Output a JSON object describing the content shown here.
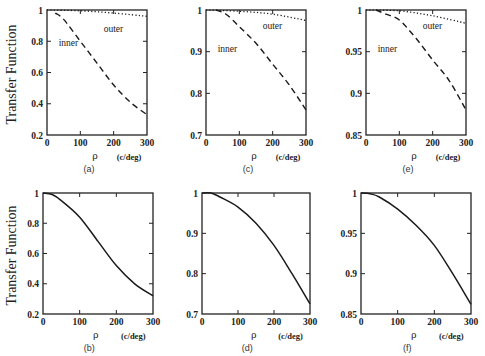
{
  "chart_data": [
    {
      "id": "a",
      "type": "line",
      "caption": "(a)",
      "xlabel": "ρ",
      "xunit": "(c/deg)",
      "ylabel": "Transfer Function",
      "xlim": [
        0,
        300
      ],
      "ylim": [
        0.2,
        1.0
      ],
      "xticks": [
        "0",
        "100",
        "200",
        "300"
      ],
      "yticks": [
        "0.2",
        "0.4",
        "0.6",
        "0.8",
        "1"
      ],
      "series": [
        {
          "name": "inner",
          "style": "dashed",
          "x": [
            25,
            50,
            100,
            150,
            200,
            250,
            300
          ],
          "y": [
            0.98,
            0.94,
            0.8,
            0.66,
            0.52,
            0.41,
            0.33
          ]
        },
        {
          "name": "outer",
          "style": "dotted",
          "x": [
            0,
            100,
            200,
            300
          ],
          "y": [
            1.0,
            0.995,
            0.98,
            0.96
          ]
        }
      ],
      "annotations": [
        {
          "text": "inner",
          "x": 35,
          "y": 0.77
        },
        {
          "text": "outer",
          "x": 170,
          "y": 0.86
        }
      ]
    },
    {
      "id": "c",
      "type": "line",
      "caption": "(c)",
      "xlabel": "ρ",
      "xunit": "(c/deg)",
      "ylabel": "",
      "xlim": [
        0,
        300
      ],
      "ylim": [
        0.7,
        1.0
      ],
      "xticks": [
        "0",
        "100",
        "200",
        "300"
      ],
      "yticks": [
        "0.7",
        "0.8",
        "0.9",
        "1"
      ],
      "series": [
        {
          "name": "inner",
          "style": "dashed",
          "x": [
            30,
            60,
            100,
            150,
            200,
            250,
            300
          ],
          "y": [
            1.0,
            0.99,
            0.96,
            0.92,
            0.87,
            0.82,
            0.76
          ]
        },
        {
          "name": "outer",
          "style": "dotted",
          "x": [
            0,
            100,
            200,
            300
          ],
          "y": [
            1.0,
            0.997,
            0.99,
            0.975
          ]
        }
      ],
      "annotations": [
        {
          "text": "inner",
          "x": 35,
          "y": 0.9
        },
        {
          "text": "outer",
          "x": 170,
          "y": 0.955
        }
      ]
    },
    {
      "id": "e",
      "type": "line",
      "caption": "(e)",
      "xlabel": "ρ",
      "xunit": "(c/deg)",
      "ylabel": "",
      "xlim": [
        0,
        300
      ],
      "ylim": [
        0.85,
        1.0
      ],
      "xticks": [
        "0",
        "100",
        "200",
        "300"
      ],
      "yticks": [
        "0.85",
        "0.9",
        "0.95",
        "1"
      ],
      "series": [
        {
          "name": "inner",
          "style": "dashed",
          "x": [
            30,
            60,
            100,
            150,
            200,
            250,
            300
          ],
          "y": [
            1.0,
            0.995,
            0.988,
            0.966,
            0.94,
            0.915,
            0.88
          ]
        },
        {
          "name": "outer",
          "style": "dotted",
          "x": [
            0,
            100,
            200,
            300
          ],
          "y": [
            1.0,
            0.999,
            0.993,
            0.984
          ]
        }
      ],
      "annotations": [
        {
          "text": "inner",
          "x": 35,
          "y": 0.95
        },
        {
          "text": "outer",
          "x": 170,
          "y": 0.977
        }
      ]
    },
    {
      "id": "b",
      "type": "line",
      "caption": "(b)",
      "xlabel": "ρ",
      "xunit": "(c/deg)",
      "ylabel": "Transfer Function",
      "xlim": [
        0,
        300
      ],
      "ylim": [
        0.2,
        1.0
      ],
      "xticks": [
        "0",
        "100",
        "200",
        "300"
      ],
      "yticks": [
        "0.2",
        "0.4",
        "0.6",
        "0.8",
        "1"
      ],
      "series": [
        {
          "name": "transfer",
          "style": "solid",
          "x": [
            0,
            25,
            50,
            100,
            150,
            200,
            250,
            300
          ],
          "y": [
            1.0,
            0.99,
            0.95,
            0.84,
            0.68,
            0.52,
            0.4,
            0.32
          ]
        }
      ]
    },
    {
      "id": "d",
      "type": "line",
      "caption": "(d)",
      "xlabel": "ρ",
      "xunit": "(c/deg)",
      "ylabel": "",
      "xlim": [
        0,
        300
      ],
      "ylim": [
        0.7,
        1.0
      ],
      "xticks": [
        "0",
        "100",
        "200",
        "300"
      ],
      "yticks": [
        "0.7",
        "0.8",
        "0.9",
        "1"
      ],
      "series": [
        {
          "name": "transfer",
          "style": "solid",
          "x": [
            0,
            25,
            50,
            100,
            150,
            200,
            250,
            300
          ],
          "y": [
            1.0,
            1.0,
            0.99,
            0.965,
            0.925,
            0.87,
            0.8,
            0.725
          ]
        }
      ]
    },
    {
      "id": "f",
      "type": "line",
      "caption": "(f)",
      "xlabel": "ρ",
      "xunit": "(c/deg)",
      "ylabel": "",
      "xlim": [
        0,
        300
      ],
      "ylim": [
        0.85,
        1.0
      ],
      "xticks": [
        "0",
        "100",
        "200",
        "300"
      ],
      "yticks": [
        "0.85",
        "0.9",
        "0.95",
        "1"
      ],
      "series": [
        {
          "name": "transfer",
          "style": "solid",
          "x": [
            0,
            25,
            50,
            100,
            150,
            200,
            250,
            300
          ],
          "y": [
            1.0,
            0.999,
            0.995,
            0.98,
            0.96,
            0.935,
            0.9,
            0.862
          ]
        }
      ]
    }
  ]
}
